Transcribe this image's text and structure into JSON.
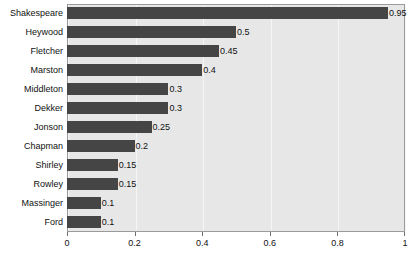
{
  "chart_data": {
    "type": "bar",
    "orientation": "horizontal",
    "title": "",
    "subtitle": "",
    "xlabel": "",
    "ylabel": "",
    "categories": [
      "Shakespeare",
      "Heywood",
      "Fletcher",
      "Marston",
      "Middleton",
      "Dekker",
      "Jonson",
      "Chapman",
      "Shirley",
      "Rowley",
      "Massinger",
      "Ford"
    ],
    "values": [
      0.95,
      0.5,
      0.45,
      0.4,
      0.3,
      0.3,
      0.25,
      0.2,
      0.15,
      0.15,
      0.1,
      0.1
    ],
    "value_labels": [
      "0.95",
      "0.5",
      "0.45",
      "0.4",
      "0.3",
      "0.3",
      "0.25",
      "0.2",
      "0.15",
      "0.15",
      "0.1",
      "0.1"
    ],
    "xlim": [
      0,
      1
    ],
    "xticks": [
      0,
      0.2,
      0.4,
      0.6,
      0.8,
      1
    ],
    "xtick_labels": [
      "0",
      "0.2",
      "0.4",
      "0.6",
      "0.8",
      "1"
    ],
    "grid": true,
    "grid_axis": "x",
    "legend": false,
    "legend_position": "none",
    "colors": {
      "bar": "#454545",
      "plot_background": "#e7e7e7",
      "figure_background": "#ffffff",
      "gridline": "#f5f5f5",
      "axis_border": "#9a9a9a",
      "text": "#111111"
    }
  }
}
